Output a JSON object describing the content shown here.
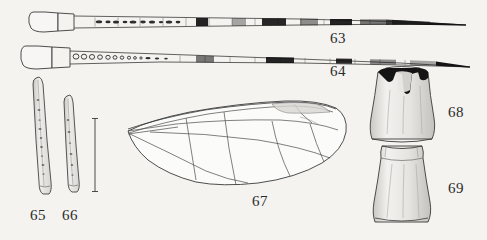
{
  "plate": {
    "title": "Entomological figure plate 63-69",
    "background_color": "#f4f3f0",
    "ink_color": "#3a3a3a",
    "fill_dark": "#1a1a1a"
  },
  "figures": [
    {
      "number": "63",
      "name": "banded-antenna-upper",
      "description": "Elongate banded antenna with enlarged basal scape",
      "label_x": 330,
      "label_y": 30
    },
    {
      "number": "64",
      "name": "banded-antenna-lower",
      "description": "Elongate banded antenna with open annuli near base",
      "label_x": 330,
      "label_y": 63
    },
    {
      "number": "65",
      "name": "slender-appendage-left",
      "description": "Slender tapering appendage, granulate surface",
      "label_x": 30,
      "label_y": 207
    },
    {
      "number": "66",
      "name": "slender-appendage-right",
      "description": "Slender tapering appendage, shorter",
      "label_x": 62,
      "label_y": 207
    },
    {
      "number": "67",
      "name": "wing",
      "description": "Insect wing with longitudinal venation and stigma",
      "label_x": 252,
      "label_y": 193
    },
    {
      "number": "68",
      "name": "segment-upper",
      "description": "Cylindrical segment with dark pigmented apical crown",
      "label_x": 448,
      "label_y": 104
    },
    {
      "number": "69",
      "name": "segment-lower",
      "description": "Cylindrical segment, pale, flared base",
      "label_x": 448,
      "label_y": 180
    }
  ],
  "scale_bar": {
    "name": "scale-bar",
    "orientation": "vertical",
    "x": 95,
    "y_top": 118,
    "y_bottom": 192
  }
}
